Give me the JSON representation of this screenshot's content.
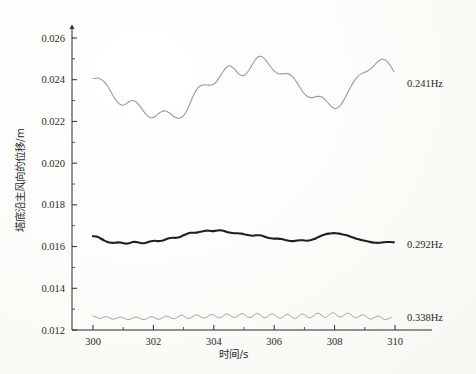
{
  "chart_data": {
    "type": "line",
    "title": "",
    "xlabel": "时间/s",
    "ylabel": "塔底沿主风向的位移/m",
    "xlim": [
      300,
      310
    ],
    "ylim": [
      0.012,
      0.026
    ],
    "xticks": [
      300,
      302,
      304,
      306,
      308,
      310
    ],
    "xtick_labels": [
      "300",
      "302",
      "304",
      "306",
      "308",
      "310"
    ],
    "yticks": [
      0.012,
      0.014,
      0.016,
      0.018,
      0.02,
      0.022,
      0.024,
      0.026
    ],
    "ytick_labels": [
      "0.012",
      "0.014",
      "0.016",
      "0.018",
      "0.020",
      "0.022",
      "0.024",
      "0.026"
    ],
    "minor_ticks": true,
    "grid": false,
    "legend_position": "right-inline-annotation",
    "series": [
      {
        "name": "0.241Hz",
        "label": "0.241Hz",
        "color": "#9a9a9a",
        "width": 1.1,
        "x": [
          300.0,
          300.12,
          300.24,
          300.36,
          300.48,
          300.6,
          300.72,
          300.84,
          300.96,
          301.08,
          301.2,
          301.32,
          301.44,
          301.56,
          301.68,
          301.8,
          301.92,
          302.04,
          302.16,
          302.28,
          302.4,
          302.52,
          302.64,
          302.76,
          302.88,
          303.0,
          303.12,
          303.24,
          303.36,
          303.48,
          303.6,
          303.72,
          303.84,
          303.96,
          304.08,
          304.2,
          304.32,
          304.44,
          304.56,
          304.68,
          304.8,
          304.92,
          305.04,
          305.16,
          305.28,
          305.4,
          305.52,
          305.64,
          305.76,
          305.88,
          306.0,
          306.12,
          306.24,
          306.36,
          306.48,
          306.6,
          306.72,
          306.84,
          306.96,
          307.08,
          307.2,
          307.32,
          307.44,
          307.56,
          307.68,
          307.8,
          307.92,
          308.04,
          308.16,
          308.28,
          308.4,
          308.52,
          308.64,
          308.76,
          308.88,
          309.0,
          309.12,
          309.24,
          309.36,
          309.48,
          309.6,
          309.72,
          309.84,
          309.96
        ],
        "y": [
          0.02405,
          0.02408,
          0.02404,
          0.02392,
          0.0237,
          0.0234,
          0.0231,
          0.02288,
          0.02278,
          0.02283,
          0.02296,
          0.023,
          0.02292,
          0.02272,
          0.02248,
          0.02228,
          0.02218,
          0.02222,
          0.02236,
          0.02248,
          0.0225,
          0.02242,
          0.02228,
          0.02218,
          0.02216,
          0.02228,
          0.02256,
          0.02296,
          0.02335,
          0.02362,
          0.02374,
          0.02376,
          0.02374,
          0.02376,
          0.0239,
          0.02414,
          0.02442,
          0.02462,
          0.02466,
          0.02452,
          0.02432,
          0.0242,
          0.02424,
          0.02444,
          0.02474,
          0.025,
          0.02512,
          0.02506,
          0.02486,
          0.02462,
          0.02442,
          0.0243,
          0.02428,
          0.0243,
          0.02428,
          0.02416,
          0.02394,
          0.02366,
          0.0234,
          0.02322,
          0.02314,
          0.02316,
          0.0232,
          0.02318,
          0.02306,
          0.02286,
          0.02268,
          0.02262,
          0.02272,
          0.02296,
          0.02328,
          0.02362,
          0.02392,
          0.02414,
          0.02428,
          0.02436,
          0.02444,
          0.02458,
          0.02476,
          0.02492,
          0.02498,
          0.0249,
          0.02468,
          0.0244
        ]
      },
      {
        "name": "0.292Hz",
        "label": "0.292Hz",
        "color": "#1f1f1f",
        "width": 2.1,
        "x": [
          300.0,
          300.12,
          300.24,
          300.36,
          300.48,
          300.6,
          300.72,
          300.84,
          300.96,
          301.08,
          301.2,
          301.32,
          301.44,
          301.56,
          301.68,
          301.8,
          301.92,
          302.04,
          302.16,
          302.28,
          302.4,
          302.52,
          302.64,
          302.76,
          302.88,
          303.0,
          303.12,
          303.24,
          303.36,
          303.48,
          303.6,
          303.72,
          303.84,
          303.96,
          304.08,
          304.2,
          304.32,
          304.44,
          304.56,
          304.68,
          304.8,
          304.92,
          305.04,
          305.16,
          305.28,
          305.4,
          305.52,
          305.64,
          305.76,
          305.88,
          306.0,
          306.12,
          306.24,
          306.36,
          306.48,
          306.6,
          306.72,
          306.84,
          306.96,
          307.08,
          307.2,
          307.32,
          307.44,
          307.56,
          307.68,
          307.8,
          307.92,
          308.04,
          308.16,
          308.28,
          308.4,
          308.52,
          308.64,
          308.76,
          308.88,
          309.0,
          309.12,
          309.24,
          309.36,
          309.48,
          309.6,
          309.72,
          309.84,
          309.96
        ],
        "y": [
          0.0165,
          0.01648,
          0.0164,
          0.0163,
          0.01622,
          0.01618,
          0.01618,
          0.0162,
          0.01618,
          0.01614,
          0.01616,
          0.01622,
          0.01622,
          0.01618,
          0.01616,
          0.0162,
          0.01626,
          0.01628,
          0.01626,
          0.01628,
          0.01634,
          0.0164,
          0.01642,
          0.01642,
          0.01646,
          0.01654,
          0.01662,
          0.01666,
          0.01666,
          0.01668,
          0.01672,
          0.01676,
          0.01676,
          0.01674,
          0.01676,
          0.01678,
          0.01676,
          0.0167,
          0.01666,
          0.01664,
          0.01664,
          0.01662,
          0.01658,
          0.01654,
          0.01652,
          0.01654,
          0.01654,
          0.0165,
          0.01644,
          0.0164,
          0.01638,
          0.01638,
          0.01636,
          0.01632,
          0.01628,
          0.01626,
          0.01628,
          0.0163,
          0.0163,
          0.01628,
          0.0163,
          0.01636,
          0.01644,
          0.01652,
          0.01658,
          0.01662,
          0.01664,
          0.01664,
          0.01662,
          0.01658,
          0.01654,
          0.01648,
          0.01642,
          0.01636,
          0.01632,
          0.01628,
          0.01624,
          0.0162,
          0.01618,
          0.01618,
          0.0162,
          0.01622,
          0.01622,
          0.0162
        ]
      },
      {
        "name": "0.338Hz",
        "label": "0.338Hz",
        "color": "#a2a2a2",
        "width": 1.0,
        "x": [
          300.0,
          300.1,
          300.2,
          300.3,
          300.4,
          300.5,
          300.6,
          300.7,
          300.8,
          300.9,
          301.0,
          301.1,
          301.2,
          301.3,
          301.4,
          301.5,
          301.6,
          301.7,
          301.8,
          301.9,
          302.0,
          302.1,
          302.2,
          302.3,
          302.4,
          302.5,
          302.6,
          302.7,
          302.8,
          302.9,
          303.0,
          303.1,
          303.2,
          303.3,
          303.4,
          303.5,
          303.6,
          303.7,
          303.8,
          303.9,
          304.0,
          304.1,
          304.2,
          304.3,
          304.4,
          304.5,
          304.6,
          304.7,
          304.8,
          304.9,
          305.0,
          305.1,
          305.2,
          305.3,
          305.4,
          305.5,
          305.6,
          305.7,
          305.8,
          305.9,
          306.0,
          306.1,
          306.2,
          306.3,
          306.4,
          306.5,
          306.6,
          306.7,
          306.8,
          306.9,
          307.0,
          307.1,
          307.2,
          307.3,
          307.4,
          307.5,
          307.6,
          307.7,
          307.8,
          307.9,
          308.0,
          308.1,
          308.2,
          308.3,
          308.4,
          308.5,
          308.6,
          308.7,
          308.8,
          308.9,
          309.0,
          309.1,
          309.2,
          309.3,
          309.4,
          309.5,
          309.6,
          309.7,
          309.8,
          309.9
        ],
        "y": [
          0.01268,
          0.01262,
          0.01256,
          0.01258,
          0.01264,
          0.01262,
          0.01254,
          0.01252,
          0.01258,
          0.01262,
          0.01258,
          0.01252,
          0.0125,
          0.01256,
          0.01262,
          0.0126,
          0.01252,
          0.0125,
          0.01256,
          0.01264,
          0.01262,
          0.01254,
          0.01252,
          0.01258,
          0.01266,
          0.01264,
          0.01256,
          0.01254,
          0.01262,
          0.0127,
          0.01268,
          0.01258,
          0.01256,
          0.01264,
          0.01272,
          0.0127,
          0.0126,
          0.01258,
          0.01266,
          0.01274,
          0.01272,
          0.01262,
          0.01258,
          0.01266,
          0.01276,
          0.01274,
          0.01264,
          0.0126,
          0.01268,
          0.01278,
          0.01276,
          0.01264,
          0.0126,
          0.01268,
          0.01278,
          0.01276,
          0.01264,
          0.01258,
          0.01266,
          0.01276,
          0.01274,
          0.01262,
          0.01256,
          0.01264,
          0.01274,
          0.01272,
          0.0126,
          0.01256,
          0.01264,
          0.01276,
          0.01274,
          0.01262,
          0.01258,
          0.01268,
          0.0128,
          0.01278,
          0.01266,
          0.0126,
          0.0127,
          0.01282,
          0.0128,
          0.01268,
          0.01262,
          0.0127,
          0.0128,
          0.01278,
          0.01266,
          0.01258,
          0.01264,
          0.01272,
          0.0127,
          0.01258,
          0.01252,
          0.01258,
          0.01266,
          0.01264,
          0.01254,
          0.0125,
          0.01256,
          0.01262
        ]
      }
    ]
  }
}
